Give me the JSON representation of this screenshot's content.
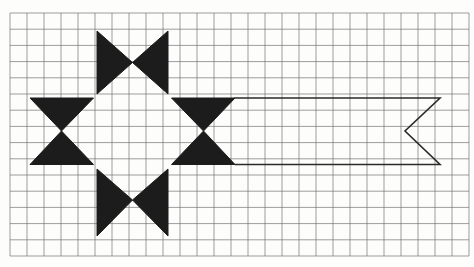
{
  "canvas": {
    "width": 474,
    "height": 267,
    "paper_color": "#fdfdfc"
  },
  "grid": {
    "x0": 10,
    "y0": 13,
    "cols": 27,
    "rows": 15,
    "cell_w": 17,
    "cell_h": 16.2,
    "line_color": "#6f6f6f",
    "line_width": 0.8,
    "line_opacity": 0.85
  },
  "figure": {
    "fill_color": "#1c1c1c",
    "stroke_color": "#2a2a2a",
    "outline_width": 1.6,
    "star": {
      "triangles": [
        {
          "name": "top-bowtie-left-triangle",
          "points": [
            [
              97,
              31
            ],
            [
              97,
              94
            ],
            [
              132.5,
              62.5
            ]
          ]
        },
        {
          "name": "top-bowtie-right-triangle",
          "points": [
            [
              168,
              31
            ],
            [
              168,
              94
            ],
            [
              132.5,
              62.5
            ]
          ]
        },
        {
          "name": "left-bowtie-top-triangle",
          "points": [
            [
              30,
              98
            ],
            [
              93.5,
              98
            ],
            [
              61.5,
              131
            ]
          ]
        },
        {
          "name": "left-bowtie-bottom-triangle",
          "points": [
            [
              30,
              164.5
            ],
            [
              93.5,
              164.5
            ],
            [
              61.5,
              131
            ]
          ]
        },
        {
          "name": "right-bowtie-top-triangle",
          "points": [
            [
              171.5,
              98
            ],
            [
              235,
              98
            ],
            [
              203.5,
              131
            ]
          ]
        },
        {
          "name": "right-bowtie-bottom-triangle",
          "points": [
            [
              171.5,
              164.5
            ],
            [
              235,
              164.5
            ],
            [
              203.5,
              131
            ]
          ]
        },
        {
          "name": "bottom-bowtie-left-triangle",
          "points": [
            [
              97,
              169
            ],
            [
              97,
              236
            ],
            [
              132.5,
              200
            ]
          ]
        },
        {
          "name": "bottom-bowtie-right-triangle",
          "points": [
            [
              168,
              169
            ],
            [
              168,
              236
            ],
            [
              132.5,
              200
            ]
          ]
        }
      ]
    },
    "ribbon": {
      "points": [
        [
          235,
          98
        ],
        [
          440,
          98
        ],
        [
          405,
          131
        ],
        [
          440,
          164.5
        ],
        [
          235,
          164.5
        ]
      ]
    }
  }
}
